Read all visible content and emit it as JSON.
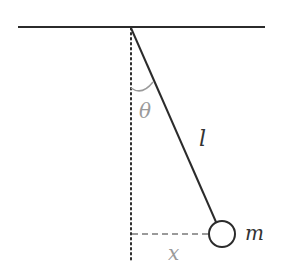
{
  "diagram": {
    "labels": {
      "angle": "θ",
      "length": "l",
      "mass": "m",
      "displacement": "x"
    },
    "colors": {
      "line": "#2b2b2b",
      "annotation": "#9a9a9a",
      "label": "#333333"
    }
  }
}
